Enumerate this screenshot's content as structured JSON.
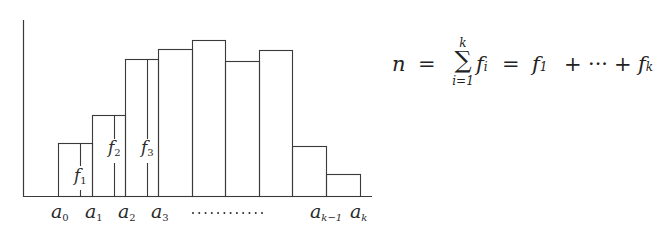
{
  "chart_data": {
    "type": "bar",
    "title": "",
    "xlabel": "",
    "ylabel": "",
    "grid": false,
    "legend": null,
    "categories": [
      "[a0,a1)",
      "[a1,a2)",
      "[a2,a3)",
      "[a3,…)",
      "…",
      "…",
      "…",
      "…",
      "[a_{k-1},a_k]"
    ],
    "values": [
      53,
      81,
      137,
      147,
      156,
      135,
      146,
      50,
      22
    ],
    "tick_labels": [
      "a0",
      "a1",
      "a2",
      "a3",
      "············",
      "a_{k-1}",
      "a_k"
    ],
    "annotations": [
      "f1",
      "f2",
      "f3"
    ],
    "formula": "n = Σ_{i=1}^{k} f_i = f_1 + ··· + f_k"
  },
  "axis": {
    "x0": 23,
    "y_top": 20,
    "baseline": 196,
    "x_end": 372
  },
  "bars": [
    {
      "x": 58,
      "w": 34,
      "top": 143
    },
    {
      "x": 92,
      "w": 33,
      "top": 115
    },
    {
      "x": 125,
      "w": 33,
      "top": 59
    },
    {
      "x": 158,
      "w": 34,
      "top": 49
    },
    {
      "x": 192,
      "w": 33,
      "top": 40
    },
    {
      "x": 225,
      "w": 34,
      "top": 61
    },
    {
      "x": 259,
      "w": 33,
      "top": 50
    },
    {
      "x": 292,
      "w": 34,
      "top": 146
    },
    {
      "x": 326,
      "w": 34,
      "top": 174
    }
  ],
  "freq_markers": [
    {
      "x": 80,
      "top": 143,
      "label_main": "f",
      "label_sub": "1",
      "label_y": 181,
      "gap_top": 166,
      "gap_bottom": 190
    },
    {
      "x": 114,
      "top": 115,
      "label_main": "f",
      "label_sub": "2",
      "label_y": 153,
      "gap_top": 139,
      "gap_bottom": 163
    },
    {
      "x": 147,
      "top": 59,
      "label_main": "f",
      "label_sub": "3",
      "label_y": 153,
      "gap_top": 139,
      "gap_bottom": 163
    }
  ],
  "x_labels": [
    {
      "main": "a",
      "sub": "0",
      "x": 51
    },
    {
      "main": "a",
      "sub": "1",
      "x": 85
    },
    {
      "main": "a",
      "sub": "2",
      "x": 118
    },
    {
      "main": "a",
      "sub": "3",
      "x": 151
    },
    {
      "main": "a",
      "sub": "k−1",
      "x": 310
    },
    {
      "main": "a",
      "sub": "k",
      "x": 350
    }
  ],
  "dots": {
    "x_start": 193,
    "x_end": 262,
    "count": 12,
    "y": 213
  },
  "formula": {
    "lhs": "n",
    "eq1": "=",
    "sigma": "∑",
    "sigma_upper": "k",
    "sigma_lower": "i=1",
    "term": "f",
    "term_sub": "i",
    "eq2": "=",
    "first": "f",
    "first_sub": "1",
    "plus1": "+",
    "ellipsis": "···",
    "plus2": "+",
    "last": "f",
    "last_sub": "k"
  },
  "colors": {
    "line": "#3a3a3a",
    "text": "#2a2a2a",
    "background": "#ffffff"
  }
}
